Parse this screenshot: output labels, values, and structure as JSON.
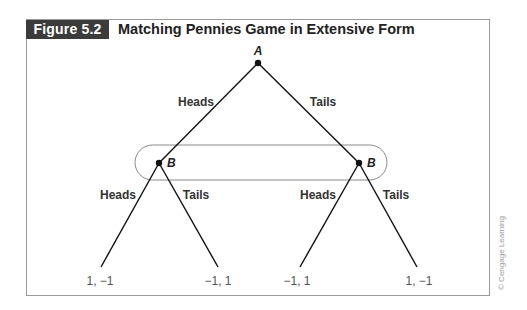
{
  "figure": {
    "label": "Figure 5.2",
    "title": "Matching Pennies Game in Extensive Form",
    "credit": "© Cengage Learning"
  },
  "tree": {
    "root": {
      "player": "A"
    },
    "first_moves": [
      {
        "label": "Heads",
        "to": "B-left"
      },
      {
        "label": "Tails",
        "to": "B-right"
      }
    ],
    "second_nodes": [
      {
        "id": "B-left",
        "player": "B",
        "moves": [
          {
            "label": "Heads",
            "payoff": "1, −1"
          },
          {
            "label": "Tails",
            "payoff": "−1, 1"
          }
        ]
      },
      {
        "id": "B-right",
        "player": "B",
        "moves": [
          {
            "label": "Heads",
            "payoff": "−1, 1"
          },
          {
            "label": "Tails",
            "payoff": "1, −1"
          }
        ]
      }
    ],
    "information_set": {
      "contains": [
        "B-left",
        "B-right"
      ]
    }
  },
  "colors": {
    "label_bg": "#3b3b3b",
    "line": "#111111",
    "frame": "#9a9a9a",
    "info_set": "#8a8a8a"
  }
}
